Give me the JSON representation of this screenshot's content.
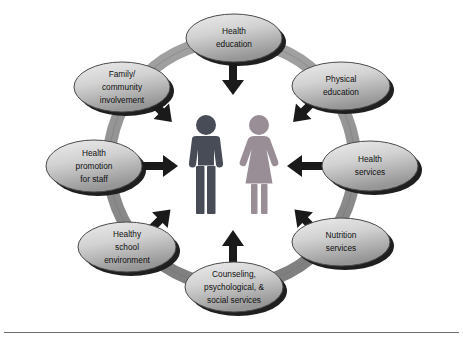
{
  "figure": {
    "type": "cycle-diagram",
    "background_color": "#ffffff",
    "rule_color": "#6b6b6b"
  },
  "palette": {
    "node_fill_light": "#e3e3e3",
    "node_fill_dark": "#9a9a9a",
    "node_stroke": "#4a4a4a",
    "node_shadow": "#1c1c1c",
    "ring_color": "#8f8f8f",
    "ring_edge": "#6f6f6f",
    "arrow_color": "#1a1a1a",
    "male_figure_color": "#474c57",
    "female_figure_color": "#9a8e96"
  },
  "center": {
    "male_figure_name": "male-figure",
    "female_figure_name": "female-figure"
  },
  "nodes": [
    {
      "id": "health-education",
      "lines": [
        "Health",
        "education"
      ],
      "cx": 234,
      "cy": 38,
      "rx": 48,
      "ry": 24,
      "arrow_direction": "down"
    },
    {
      "id": "physical-education",
      "lines": [
        "Physical",
        "education"
      ],
      "cx": 341,
      "cy": 86,
      "rx": 49,
      "ry": 24,
      "arrow_direction": "down-left"
    },
    {
      "id": "health-services",
      "lines": [
        "Health",
        "services"
      ],
      "cx": 370,
      "cy": 166,
      "rx": 48,
      "ry": 25,
      "arrow_direction": "left"
    },
    {
      "id": "nutrition-services",
      "lines": [
        "Nutrition",
        "services"
      ],
      "cx": 341,
      "cy": 242,
      "rx": 49,
      "ry": 24,
      "arrow_direction": "up-left"
    },
    {
      "id": "counseling-psychological-social-services",
      "lines": [
        "Counseling,",
        "psychological, &",
        "social services"
      ],
      "cx": 234,
      "cy": 287,
      "rx": 49,
      "ry": 25,
      "arrow_direction": "up"
    },
    {
      "id": "healthy-school-environment",
      "lines": [
        "Healthy",
        "school",
        "environment"
      ],
      "cx": 127,
      "cy": 247,
      "rx": 49,
      "ry": 25,
      "arrow_direction": "up-right"
    },
    {
      "id": "health-promotion-for-staff",
      "lines": [
        "Health",
        "promotion",
        "for staff"
      ],
      "cx": 94,
      "cy": 166,
      "rx": 48,
      "ry": 26,
      "arrow_direction": "right"
    },
    {
      "id": "family-community-involvement",
      "lines": [
        "Family/",
        "community",
        "involvement"
      ],
      "cx": 122,
      "cy": 87,
      "rx": 48,
      "ry": 25,
      "arrow_direction": "down-right"
    }
  ]
}
